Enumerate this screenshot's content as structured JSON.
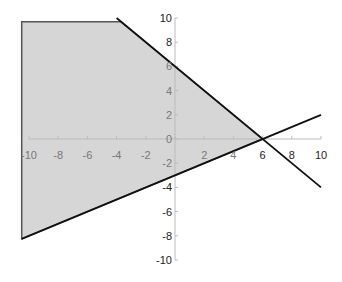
{
  "chart_data": {
    "type": "line",
    "title": "",
    "xlabel": "",
    "ylabel": "",
    "xlim": [
      -10,
      10
    ],
    "ylim": [
      -10,
      10
    ],
    "grid": false,
    "legend": null,
    "x_ticks": [
      "-10",
      "-8",
      "-6",
      "-4",
      "-2",
      "0",
      "2",
      "4",
      "6",
      "8",
      "10"
    ],
    "y_ticks": [
      "10",
      "8",
      "6",
      "4",
      "2",
      "0",
      "-2",
      "-4",
      "-6",
      "-8",
      "-10"
    ],
    "series": [
      {
        "name": "line-decreasing",
        "equation": "y = -x + 6",
        "points": [
          [
            -4,
            10
          ],
          [
            10,
            -4
          ]
        ],
        "color": "#111111"
      },
      {
        "name": "line-increasing",
        "equation": "y = 0.5x - 3",
        "points": [
          [
            -10.5,
            -8.25
          ],
          [
            10,
            2
          ]
        ],
        "color": "#111111"
      }
    ],
    "shaded_region": {
      "description": "feasible region: y <= -x + 6, y >= 0.5x - 3, x >= -10.5, y <= 9.7",
      "vertices": [
        [
          -10.5,
          9.7
        ],
        [
          -3.7,
          9.7
        ],
        [
          6,
          0
        ],
        [
          -10.5,
          -8.25
        ]
      ],
      "fill": "#d6d6d6"
    }
  }
}
